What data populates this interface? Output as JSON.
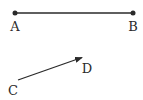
{
  "diagram": {
    "segment_ab": {
      "start": {
        "label": "A",
        "x": 15,
        "y": 13
      },
      "end": {
        "label": "B",
        "x": 133,
        "y": 13
      },
      "type": "segment-with-endpoints"
    },
    "vector_cd": {
      "start": {
        "label": "C",
        "x": 18,
        "y": 80
      },
      "end": {
        "label": "D",
        "x": 83,
        "y": 57
      },
      "type": "arrow"
    },
    "labels": {
      "a": "A",
      "b": "B",
      "c": "C",
      "d": "D"
    },
    "colors": {
      "stroke": "#2a2a2a",
      "background": "#ffffff"
    }
  }
}
